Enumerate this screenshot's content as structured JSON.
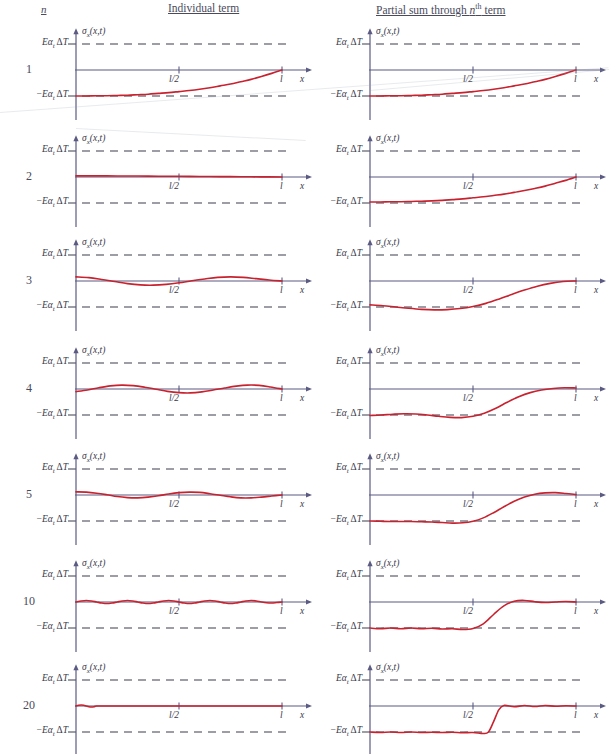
{
  "header": {
    "n_label": "n",
    "individual_label": "Individual term",
    "partial_label_pre": "Partial sum through ",
    "partial_label_n": "n",
    "partial_label_sup": "th",
    "partial_label_post": " term"
  },
  "axes": {
    "y_top_label": "Eα",
    "y_top_sub": "t",
    "y_top_rest": "ΔT",
    "y_bottom_prefix": "−",
    "y_axis_name_sigma": "σ",
    "y_axis_name_sub": "x",
    "y_axis_name_args": "(x,t)",
    "x_tick_mid": "l/2",
    "x_tick_end": "l",
    "x_axis_name": "x"
  },
  "colors": {
    "curve": "#c8222f",
    "axis": "#5a5a82",
    "dashed": "#3c3c4e",
    "text": "#3a3a4a"
  },
  "rows": [
    {
      "n": "1",
      "individual_desc": "single rising exponential-like term from -EaΔT to 0 at l",
      "partial_desc": "same as individual term"
    },
    {
      "n": "2",
      "individual_desc": "nearly flat small positive term near zero",
      "partial_desc": "rising curve from -EaΔT to 0 at l"
    },
    {
      "n": "3",
      "individual_desc": "one full oscillation about zero, small amplitude",
      "partial_desc": "dips below -EaΔT then rises smoothly to 0 at l"
    },
    {
      "n": "4",
      "individual_desc": "one and a half oscillations about zero",
      "partial_desc": "small dip, then sigmoid rise overshooting slightly above 0"
    },
    {
      "n": "5",
      "individual_desc": "two and a half oscillations about zero, small amplitude",
      "partial_desc": "flat at -EaΔT then sigmoid rise with overshoot above 0"
    },
    {
      "n": "10",
      "individual_desc": "about five oscillations, small amplitude",
      "partial_desc": "ripples along -EaΔT then sharp rise with Gibbs ripples near 0"
    },
    {
      "n": "20",
      "individual_desc": "about ten oscillations, very small amplitude",
      "partial_desc": "dense ripples along -EaΔT, steep jump near 0.62l, ripples near 0"
    }
  ],
  "chart_data": {
    "type": "line",
    "xlabel": "x",
    "ylabel": "σ_x(x,t)",
    "xlim": [
      0,
      1
    ],
    "ylim": [
      -1.35,
      1.35
    ],
    "x_ticks": [
      0.5,
      1.0
    ],
    "x_ticklabels": [
      "l/2",
      "l"
    ],
    "y_ticks": [
      -1,
      1
    ],
    "y_ticklabels": [
      "−Eα_t ΔT",
      "Eα_t ΔT"
    ],
    "grid": false,
    "legend": false,
    "reference_lines": [
      {
        "y": 1.0,
        "style": "dashed",
        "label": "Eα_t ΔT"
      },
      {
        "y": -1.0,
        "style": "dashed",
        "label": "−Eα_t ΔT"
      },
      {
        "y": 0.0,
        "style": "solid",
        "label": "x-axis"
      }
    ],
    "panels": [
      {
        "n": 1,
        "column": "Individual term",
        "x": [
          0,
          0.05,
          0.1,
          0.15,
          0.2,
          0.25,
          0.3,
          0.35,
          0.4,
          0.45,
          0.5,
          0.55,
          0.6,
          0.65,
          0.7,
          0.75,
          0.8,
          0.85,
          0.9,
          0.95,
          1.0
        ],
        "y": [
          -1.0,
          -1.0,
          -0.99,
          -0.99,
          -0.98,
          -0.97,
          -0.95,
          -0.93,
          -0.9,
          -0.87,
          -0.83,
          -0.79,
          -0.74,
          -0.68,
          -0.61,
          -0.54,
          -0.45,
          -0.36,
          -0.25,
          -0.13,
          0.0
        ]
      },
      {
        "n": 1,
        "column": "Partial sum through nth term",
        "x": [
          0,
          0.05,
          0.1,
          0.15,
          0.2,
          0.25,
          0.3,
          0.35,
          0.4,
          0.45,
          0.5,
          0.55,
          0.6,
          0.65,
          0.7,
          0.75,
          0.8,
          0.85,
          0.9,
          0.95,
          1.0
        ],
        "y": [
          -1.0,
          -1.0,
          -0.99,
          -0.99,
          -0.98,
          -0.97,
          -0.95,
          -0.93,
          -0.9,
          -0.87,
          -0.83,
          -0.79,
          -0.74,
          -0.68,
          -0.61,
          -0.54,
          -0.45,
          -0.36,
          -0.25,
          -0.13,
          0.0
        ]
      },
      {
        "n": 2,
        "column": "Individual term",
        "x": [
          0,
          0.1,
          0.2,
          0.3,
          0.4,
          0.5,
          0.6,
          0.7,
          0.8,
          0.9,
          1.0
        ],
        "y": [
          0.045,
          0.043,
          0.04,
          0.036,
          0.031,
          0.026,
          0.021,
          0.016,
          0.011,
          0.005,
          0.0
        ]
      },
      {
        "n": 2,
        "column": "Partial sum through nth term",
        "x": [
          0,
          0.05,
          0.1,
          0.15,
          0.2,
          0.25,
          0.3,
          0.35,
          0.4,
          0.45,
          0.5,
          0.55,
          0.6,
          0.65,
          0.7,
          0.75,
          0.8,
          0.85,
          0.9,
          0.95,
          1.0
        ],
        "y": [
          -0.96,
          -0.96,
          -0.95,
          -0.95,
          -0.94,
          -0.93,
          -0.92,
          -0.9,
          -0.87,
          -0.84,
          -0.8,
          -0.76,
          -0.71,
          -0.66,
          -0.59,
          -0.52,
          -0.44,
          -0.35,
          -0.24,
          -0.13,
          0.0
        ]
      },
      {
        "n": 3,
        "column": "Individual term",
        "x": [
          0,
          0.0625,
          0.125,
          0.1875,
          0.25,
          0.3125,
          0.375,
          0.4375,
          0.5,
          0.5625,
          0.625,
          0.6875,
          0.75,
          0.8125,
          0.875,
          0.9375,
          1.0
        ],
        "y": [
          0.16,
          0.13,
          0.06,
          -0.02,
          -0.1,
          -0.15,
          -0.16,
          -0.13,
          -0.07,
          0.01,
          0.08,
          0.14,
          0.16,
          0.14,
          0.09,
          0.04,
          0.0
        ]
      },
      {
        "n": 3,
        "column": "Partial sum through nth term",
        "x": [
          0,
          0.0625,
          0.125,
          0.1875,
          0.25,
          0.3125,
          0.375,
          0.4375,
          0.5,
          0.5625,
          0.625,
          0.6875,
          0.75,
          0.8125,
          0.875,
          0.9375,
          1.0
        ],
        "y": [
          -0.92,
          -0.95,
          -1.0,
          -1.05,
          -1.09,
          -1.11,
          -1.1,
          -1.06,
          -0.98,
          -0.86,
          -0.7,
          -0.52,
          -0.35,
          -0.2,
          -0.09,
          -0.02,
          0.0
        ]
      },
      {
        "n": 4,
        "column": "Individual term",
        "x": [
          0,
          0.0555,
          0.111,
          0.1665,
          0.222,
          0.278,
          0.333,
          0.389,
          0.444,
          0.5,
          0.555,
          0.611,
          0.666,
          0.722,
          0.778,
          0.833,
          0.889,
          0.944,
          1.0
        ],
        "y": [
          -0.1,
          -0.04,
          0.05,
          0.12,
          0.15,
          0.13,
          0.07,
          -0.01,
          -0.09,
          -0.14,
          -0.15,
          -0.11,
          -0.04,
          0.04,
          0.11,
          0.15,
          0.14,
          0.08,
          0.0
        ]
      },
      {
        "n": 4,
        "column": "Partial sum through nth term",
        "x": [
          0,
          0.0555,
          0.111,
          0.1665,
          0.222,
          0.278,
          0.333,
          0.389,
          0.444,
          0.5,
          0.555,
          0.611,
          0.666,
          0.722,
          0.778,
          0.833,
          0.889,
          0.944,
          1.0
        ],
        "y": [
          -1.02,
          -1.0,
          -0.97,
          -0.95,
          -0.96,
          -1.0,
          -1.05,
          -1.09,
          -1.1,
          -1.05,
          -0.93,
          -0.74,
          -0.51,
          -0.3,
          -0.14,
          -0.04,
          0.02,
          0.05,
          0.04
        ]
      },
      {
        "n": 5,
        "column": "Individual term",
        "x": [
          0,
          0.05,
          0.1,
          0.15,
          0.2,
          0.25,
          0.3,
          0.35,
          0.4,
          0.45,
          0.5,
          0.55,
          0.6,
          0.65,
          0.7,
          0.75,
          0.8,
          0.85,
          0.9,
          0.95,
          1.0
        ],
        "y": [
          0.12,
          0.11,
          0.07,
          0.01,
          -0.06,
          -0.1,
          -0.11,
          -0.08,
          -0.03,
          0.04,
          0.09,
          0.11,
          0.1,
          0.05,
          -0.01,
          -0.07,
          -0.11,
          -0.11,
          -0.08,
          -0.04,
          0.0
        ]
      },
      {
        "n": 5,
        "column": "Partial sum through nth term",
        "x": [
          0,
          0.05,
          0.1,
          0.15,
          0.2,
          0.25,
          0.3,
          0.35,
          0.4,
          0.45,
          0.5,
          0.55,
          0.6,
          0.65,
          0.7,
          0.75,
          0.8,
          0.85,
          0.9,
          0.95,
          1.0
        ],
        "y": [
          -1.0,
          -1.01,
          -1.02,
          -1.02,
          -1.02,
          -1.03,
          -1.04,
          -1.06,
          -1.08,
          -1.07,
          -1.01,
          -0.88,
          -0.68,
          -0.45,
          -0.24,
          -0.08,
          0.03,
          0.08,
          0.09,
          0.06,
          0.02
        ]
      },
      {
        "n": 10,
        "column": "Individual term",
        "x": [
          0,
          0.025,
          0.05,
          0.075,
          0.1,
          0.125,
          0.15,
          0.175,
          0.2,
          0.225,
          0.25,
          0.275,
          0.3,
          0.325,
          0.35,
          0.375,
          0.4,
          0.425,
          0.45,
          0.475,
          0.5,
          0.525,
          0.55,
          0.575,
          0.6,
          0.625,
          0.65,
          0.675,
          0.7,
          0.725,
          0.75,
          0.775,
          0.8,
          0.825,
          0.85,
          0.875,
          0.9,
          0.925,
          0.95,
          0.975,
          1.0
        ],
        "y": [
          0.0,
          0.04,
          0.06,
          0.04,
          0.0,
          -0.04,
          -0.06,
          -0.04,
          0.0,
          0.04,
          0.06,
          0.04,
          0.0,
          -0.04,
          -0.06,
          -0.04,
          0.0,
          0.04,
          0.06,
          0.04,
          0.0,
          -0.04,
          -0.06,
          -0.04,
          0.0,
          0.04,
          0.06,
          0.04,
          0.0,
          -0.04,
          -0.06,
          -0.04,
          0.0,
          0.04,
          0.06,
          0.04,
          0.0,
          -0.03,
          -0.04,
          -0.02,
          0.0
        ]
      },
      {
        "n": 10,
        "column": "Partial sum through nth term",
        "x": [
          0,
          0.05,
          0.1,
          0.15,
          0.2,
          0.25,
          0.3,
          0.35,
          0.4,
          0.45,
          0.5,
          0.55,
          0.6,
          0.65,
          0.7,
          0.75,
          0.8,
          0.85,
          0.9,
          0.95,
          1.0
        ],
        "y": [
          -1.0,
          -1.03,
          -1.0,
          -1.03,
          -1.0,
          -1.03,
          -1.01,
          -1.04,
          -1.03,
          -1.06,
          -1.02,
          -0.84,
          -0.48,
          -0.15,
          0.03,
          0.06,
          0.01,
          -0.02,
          0.0,
          0.02,
          0.0
        ]
      },
      {
        "n": 20,
        "column": "Individual term",
        "x": [
          0,
          0.0125,
          0.025,
          0.0375,
          0.05,
          0.0625,
          0.075,
          0.0875,
          0.1,
          0.15,
          0.2,
          0.25,
          0.3,
          0.35,
          0.4,
          0.45,
          0.5,
          0.55,
          0.6,
          0.65,
          0.7,
          0.75,
          0.8,
          0.85,
          0.9,
          0.95,
          1.0
        ],
        "y": [
          0.0,
          0.03,
          0.04,
          0.03,
          0.0,
          -0.03,
          -0.04,
          -0.03,
          0.0,
          0.0,
          0.0,
          0.0,
          0.0,
          0.0,
          0.0,
          0.0,
          0.0,
          0.0,
          0.0,
          0.0,
          0.0,
          0.0,
          0.0,
          0.0,
          0.0,
          0.0,
          0.0
        ]
      },
      {
        "n": 20,
        "column": "Partial sum through nth term",
        "x": [
          0,
          0.05,
          0.1,
          0.15,
          0.2,
          0.25,
          0.3,
          0.35,
          0.4,
          0.45,
          0.5,
          0.55,
          0.575,
          0.6,
          0.625,
          0.65,
          0.7,
          0.75,
          0.8,
          0.85,
          0.9,
          0.95,
          1.0
        ],
        "y": [
          -1.0,
          -1.02,
          -1.0,
          -1.02,
          -1.0,
          -1.02,
          -1.01,
          -1.02,
          -1.01,
          -1.03,
          -1.02,
          -1.06,
          -1.0,
          -0.6,
          -0.15,
          0.02,
          -0.03,
          0.02,
          -0.02,
          0.02,
          -0.01,
          0.01,
          0.0
        ]
      }
    ]
  }
}
